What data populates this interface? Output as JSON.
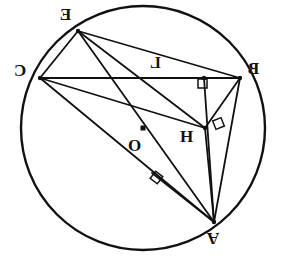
{
  "figure": {
    "background_color": "#ffffff",
    "stroke_color": "#111111",
    "width": 285,
    "height": 266
  },
  "circle": {
    "name": "circumcircle",
    "cx": 143,
    "cy": 128,
    "r": 122,
    "stroke_width": 2.4
  },
  "points": [
    {
      "id": "E",
      "label": "E",
      "x": 78,
      "y": 31,
      "mirrored": true,
      "label_x": 60,
      "label_y": 6,
      "font_size": 17
    },
    {
      "id": "C",
      "label": "C",
      "x": 40,
      "y": 78,
      "mirrored": true,
      "label_x": 14,
      "label_y": 62,
      "font_size": 17
    },
    {
      "id": "B",
      "label": "B",
      "x": 240,
      "y": 78,
      "mirrored": true,
      "label_x": 248,
      "label_y": 60,
      "font_size": 17
    },
    {
      "id": "A",
      "label": "A",
      "x": 214,
      "y": 222,
      "mirrored": true,
      "label_x": 207,
      "label_y": 230,
      "font_size": 17
    },
    {
      "id": "H",
      "label": "H",
      "x": 205,
      "y": 128,
      "mirrored": false,
      "label_x": 180,
      "label_y": 128,
      "font_size": 17
    },
    {
      "id": "O",
      "label": "O",
      "x": 143,
      "y": 128,
      "mirrored": false,
      "label_x": 128,
      "label_y": 137,
      "font_size": 17
    },
    {
      "id": "L",
      "label": "L",
      "x": 204,
      "y": 78,
      "mirrored": true,
      "label_x": 150,
      "label_y": 55,
      "font_size": 16
    }
  ],
  "center_marker": {
    "name": "center-point-O",
    "x": 143,
    "y": 128,
    "size": 5,
    "shape": "filled-square"
  },
  "segments": [
    {
      "name": "segment-C-B",
      "x1": 40,
      "y1": 78,
      "x2": 240,
      "y2": 78
    },
    {
      "name": "segment-E-C",
      "x1": 78,
      "y1": 31,
      "x2": 40,
      "y2": 78
    },
    {
      "name": "segment-E-B",
      "x1": 78,
      "y1": 31,
      "x2": 240,
      "y2": 78
    },
    {
      "name": "segment-E-H",
      "x1": 78,
      "y1": 31,
      "x2": 205,
      "y2": 128
    },
    {
      "name": "segment-E-A",
      "x1": 78,
      "y1": 31,
      "x2": 214,
      "y2": 222
    },
    {
      "name": "segment-C-H",
      "x1": 40,
      "y1": 78,
      "x2": 205,
      "y2": 128
    },
    {
      "name": "segment-C-A",
      "x1": 40,
      "y1": 78,
      "x2": 214,
      "y2": 222
    },
    {
      "name": "segment-B-A",
      "x1": 240,
      "y1": 78,
      "x2": 214,
      "y2": 222
    },
    {
      "name": "segment-B-L-A-altitude",
      "x1": 204,
      "y1": 78,
      "x2": 214,
      "y2": 222
    },
    {
      "name": "segment-H-A",
      "x1": 205,
      "y1": 128,
      "x2": 214,
      "y2": 222
    },
    {
      "name": "segment-H-B",
      "x1": 205,
      "y1": 128,
      "x2": 240,
      "y2": 78
    },
    {
      "name": "segment-A-foot-on-CA",
      "x1": 214,
      "y1": 222,
      "x2": 152,
      "y2": 173
    }
  ],
  "right_angle_marks": [
    {
      "name": "right-angle-at-L",
      "x": 198,
      "y": 79,
      "size": 9,
      "rotation": 0
    },
    {
      "name": "right-angle-at-H",
      "x": 214,
      "y": 119,
      "size": 9,
      "rotation": -22
    },
    {
      "name": "right-angle-on-CA",
      "x": 152,
      "y": 173,
      "size": 9,
      "rotation": 38
    }
  ],
  "annotations": {
    "caption": "",
    "note": ""
  }
}
